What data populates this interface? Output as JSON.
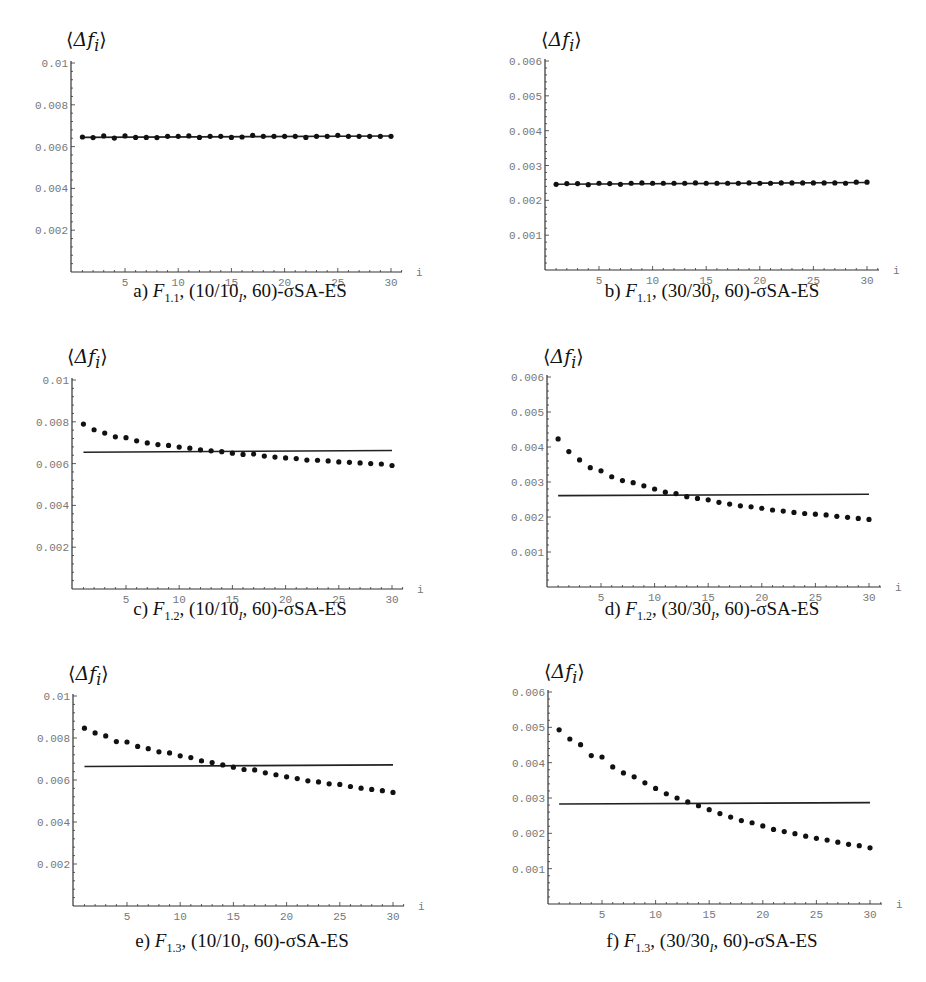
{
  "chart_data": [
    {
      "id": "a",
      "type": "scatter",
      "title": "a) F1.1, (10/10I, 60)-σSA-ES",
      "caption": {
        "letter": "a)",
        "func": "F",
        "func_sub": "1.1",
        "mu": "10/10",
        "mu_sub": "I",
        "lambda": "60",
        "suffix": "-σSA-ES"
      },
      "ylabel": "⟨Δf_i⟩",
      "xlabel": "i",
      "ylim": [
        0,
        0.01
      ],
      "xlim": [
        0,
        31
      ],
      "yticks": [
        0.002,
        0.004,
        0.006,
        0.008,
        0.01
      ],
      "ytick_labels": [
        "0.002",
        "0.004",
        "0.006",
        "0.008",
        "0.01"
      ],
      "xticks": [
        5,
        10,
        15,
        20,
        25,
        30
      ],
      "grid": false,
      "x": [
        1,
        2,
        3,
        4,
        5,
        6,
        7,
        8,
        9,
        10,
        11,
        12,
        13,
        14,
        15,
        16,
        17,
        18,
        19,
        20,
        21,
        22,
        23,
        24,
        25,
        26,
        27,
        28,
        29,
        30
      ],
      "series": [
        {
          "name": "measured",
          "style": "dots",
          "values": [
            0.00646,
            0.00643,
            0.00651,
            0.00641,
            0.00651,
            0.00644,
            0.00644,
            0.00643,
            0.00649,
            0.00649,
            0.00651,
            0.00644,
            0.00649,
            0.00649,
            0.00644,
            0.00646,
            0.00654,
            0.00649,
            0.00649,
            0.00649,
            0.00649,
            0.00644,
            0.00649,
            0.00649,
            0.00654,
            0.00649,
            0.00649,
            0.00649,
            0.00649,
            0.00649
          ]
        },
        {
          "name": "theory",
          "style": "line",
          "values_endpoints": [
            0.00644,
            0.00651
          ]
        }
      ]
    },
    {
      "id": "b",
      "type": "scatter",
      "title": "b) F1.1, (30/30I, 60)-σSA-ES",
      "caption": {
        "letter": "b)",
        "func": "F",
        "func_sub": "1.1",
        "mu": "30/30",
        "mu_sub": "I",
        "lambda": "60",
        "suffix": "-σSA-ES"
      },
      "ylabel": "⟨Δf_i⟩",
      "xlabel": "i",
      "ylim": [
        0,
        0.006
      ],
      "xlim": [
        0,
        31
      ],
      "yticks": [
        0.001,
        0.002,
        0.003,
        0.004,
        0.005,
        0.006
      ],
      "ytick_labels": [
        "0.001",
        "0.002",
        "0.003",
        "0.004",
        "0.005",
        "0.006"
      ],
      "xticks": [
        5,
        10,
        15,
        20,
        25,
        30
      ],
      "grid": false,
      "x": [
        1,
        2,
        3,
        4,
        5,
        6,
        7,
        8,
        9,
        10,
        11,
        12,
        13,
        14,
        15,
        16,
        17,
        18,
        19,
        20,
        21,
        22,
        23,
        24,
        25,
        26,
        27,
        28,
        29,
        30
      ],
      "series": [
        {
          "name": "measured",
          "style": "dots",
          "values": [
            0.00246,
            0.00248,
            0.00248,
            0.00245,
            0.00249,
            0.00248,
            0.00246,
            0.00249,
            0.0025,
            0.00249,
            0.00249,
            0.00249,
            0.00249,
            0.0025,
            0.00249,
            0.00249,
            0.00249,
            0.00249,
            0.0025,
            0.00249,
            0.00249,
            0.0025,
            0.0025,
            0.0025,
            0.0025,
            0.0025,
            0.0025,
            0.00249,
            0.00252,
            0.00252
          ]
        },
        {
          "name": "theory",
          "style": "line",
          "values_endpoints": [
            0.00246,
            0.00251
          ]
        }
      ]
    },
    {
      "id": "c",
      "type": "scatter",
      "title": "c) F1.2, (10/10I, 60)-σSA-ES",
      "caption": {
        "letter": "c)",
        "func": "F",
        "func_sub": "1.2",
        "mu": "10/10",
        "mu_sub": "I",
        "lambda": "60",
        "suffix": "-σSA-ES"
      },
      "ylabel": "⟨Δf_i⟩",
      "xlabel": "i",
      "ylim": [
        0,
        0.01
      ],
      "xlim": [
        0,
        31
      ],
      "yticks": [
        0.002,
        0.004,
        0.006,
        0.008,
        0.01
      ],
      "ytick_labels": [
        "0.002",
        "0.004",
        "0.006",
        "0.008",
        "0.01"
      ],
      "xticks": [
        5,
        10,
        15,
        20,
        25,
        30
      ],
      "grid": false,
      "x": [
        1,
        2,
        3,
        4,
        5,
        6,
        7,
        8,
        9,
        10,
        11,
        12,
        13,
        14,
        15,
        16,
        17,
        18,
        19,
        20,
        21,
        22,
        23,
        24,
        25,
        26,
        27,
        28,
        29,
        30
      ],
      "series": [
        {
          "name": "measured",
          "style": "dots",
          "values": [
            0.00789,
            0.00762,
            0.00746,
            0.00728,
            0.00724,
            0.00709,
            0.00699,
            0.00691,
            0.00687,
            0.00679,
            0.00674,
            0.00666,
            0.00661,
            0.00657,
            0.0065,
            0.00644,
            0.00646,
            0.00636,
            0.00631,
            0.00627,
            0.00624,
            0.00617,
            0.00616,
            0.00613,
            0.00608,
            0.00606,
            0.00603,
            0.006,
            0.00598,
            0.00591
          ]
        },
        {
          "name": "theory",
          "style": "line",
          "values_endpoints": [
            0.00654,
            0.00663
          ]
        }
      ]
    },
    {
      "id": "d",
      "type": "scatter",
      "title": "d) F1.2, (30/30I, 60)-σSA-ES",
      "caption": {
        "letter": "d)",
        "func": "F",
        "func_sub": "1.2",
        "mu": "30/30",
        "mu_sub": "I",
        "lambda": "60",
        "suffix": "-σSA-ES"
      },
      "ylabel": "⟨Δf_i⟩",
      "xlabel": "i",
      "ylim": [
        0,
        0.006
      ],
      "xlim": [
        0,
        31
      ],
      "yticks": [
        0.001,
        0.002,
        0.003,
        0.004,
        0.005,
        0.006
      ],
      "ytick_labels": [
        "0.001",
        "0.002",
        "0.003",
        "0.004",
        "0.005",
        "0.006"
      ],
      "xticks": [
        5,
        10,
        15,
        20,
        25,
        30
      ],
      "grid": false,
      "x": [
        1,
        2,
        3,
        4,
        5,
        6,
        7,
        8,
        9,
        10,
        11,
        12,
        13,
        14,
        15,
        16,
        17,
        18,
        19,
        20,
        21,
        22,
        23,
        24,
        25,
        26,
        27,
        28,
        29,
        30
      ],
      "series": [
        {
          "name": "measured",
          "style": "dots",
          "values": [
            0.00423,
            0.00387,
            0.00363,
            0.00341,
            0.00332,
            0.00315,
            0.00304,
            0.00298,
            0.00289,
            0.0028,
            0.00271,
            0.00267,
            0.00258,
            0.00253,
            0.00249,
            0.00242,
            0.00237,
            0.00232,
            0.00229,
            0.00225,
            0.0022,
            0.00217,
            0.00213,
            0.0021,
            0.00208,
            0.00206,
            0.00202,
            0.00199,
            0.00196,
            0.00193
          ]
        },
        {
          "name": "theory",
          "style": "line",
          "values_endpoints": [
            0.00261,
            0.00265
          ]
        }
      ]
    },
    {
      "id": "e",
      "type": "scatter",
      "title": "e) F1.3, (10/10I, 60)-σSA-ES",
      "caption": {
        "letter": "e)",
        "func": "F",
        "func_sub": "1.3",
        "mu": "10/10",
        "mu_sub": "I",
        "lambda": "60",
        "suffix": "-σSA-ES"
      },
      "ylabel": "⟨Δf_i⟩",
      "xlabel": "i",
      "ylim": [
        0,
        0.01
      ],
      "xlim": [
        0,
        31
      ],
      "yticks": [
        0.002,
        0.004,
        0.006,
        0.008,
        0.01
      ],
      "ytick_labels": [
        "0.002",
        "0.004",
        "0.006",
        "0.008",
        "0.01"
      ],
      "xticks": [
        5,
        10,
        15,
        20,
        25,
        30
      ],
      "grid": false,
      "x": [
        1,
        2,
        3,
        4,
        5,
        6,
        7,
        8,
        9,
        10,
        11,
        12,
        13,
        14,
        15,
        16,
        17,
        18,
        19,
        20,
        21,
        22,
        23,
        24,
        25,
        26,
        27,
        28,
        29,
        30
      ],
      "series": [
        {
          "name": "measured",
          "style": "dots",
          "values": [
            0.00847,
            0.00824,
            0.0081,
            0.00783,
            0.00781,
            0.0076,
            0.00749,
            0.00734,
            0.00729,
            0.00715,
            0.00707,
            0.00691,
            0.00683,
            0.00672,
            0.00661,
            0.0065,
            0.00648,
            0.00634,
            0.00625,
            0.00615,
            0.00607,
            0.00596,
            0.00591,
            0.00582,
            0.00579,
            0.00569,
            0.00561,
            0.00555,
            0.00549,
            0.00541
          ]
        },
        {
          "name": "theory",
          "style": "line",
          "values_endpoints": [
            0.00664,
            0.00672
          ]
        }
      ]
    },
    {
      "id": "f",
      "type": "scatter",
      "title": "f) F1.3, (30/30I, 60)-σSA-ES",
      "caption": {
        "letter": "f)",
        "func": "F",
        "func_sub": "1.3",
        "mu": "30/30",
        "mu_sub": "I",
        "lambda": "60",
        "suffix": "-σSA-ES"
      },
      "ylabel": "⟨Δf_i⟩",
      "xlabel": "i",
      "ylim": [
        0,
        0.006
      ],
      "xlim": [
        0,
        31
      ],
      "yticks": [
        0.001,
        0.002,
        0.003,
        0.004,
        0.005,
        0.006
      ],
      "ytick_labels": [
        "0.001",
        "0.002",
        "0.003",
        "0.004",
        "0.005",
        "0.006"
      ],
      "xticks": [
        5,
        10,
        15,
        20,
        25,
        30
      ],
      "grid": false,
      "x": [
        1,
        2,
        3,
        4,
        5,
        6,
        7,
        8,
        9,
        10,
        11,
        12,
        13,
        14,
        15,
        16,
        17,
        18,
        19,
        20,
        21,
        22,
        23,
        24,
        25,
        26,
        27,
        28,
        29,
        30
      ],
      "series": [
        {
          "name": "measured",
          "style": "dots",
          "values": [
            0.00493,
            0.00467,
            0.00451,
            0.0042,
            0.00416,
            0.00388,
            0.00371,
            0.0036,
            0.00343,
            0.00327,
            0.00312,
            0.003,
            0.00289,
            0.00278,
            0.00267,
            0.00256,
            0.00246,
            0.00236,
            0.0023,
            0.00221,
            0.00211,
            0.00205,
            0.00199,
            0.00192,
            0.00186,
            0.00181,
            0.00175,
            0.00169,
            0.00165,
            0.00159
          ]
        },
        {
          "name": "theory",
          "style": "line",
          "values_endpoints": [
            0.00283,
            0.00287
          ]
        }
      ]
    }
  ],
  "panels_layout": [
    {
      "id": "a",
      "origin": [
        71,
        272
      ],
      "top_y": 63,
      "x5": 125,
      "x30": 391,
      "axis_end_x": 402,
      "ylabel_pos": [
        66,
        28
      ],
      "caption_pos": [
        240,
        280
      ]
    },
    {
      "id": "b",
      "origin": [
        545,
        270
      ],
      "top_y": 61,
      "x5": 599,
      "x30": 867,
      "axis_end_x": 879,
      "ylabel_pos": [
        541,
        28
      ],
      "caption_pos": [
        712,
        280
      ]
    },
    {
      "id": "c",
      "origin": [
        72,
        589
      ],
      "top_y": 380,
      "x5": 126,
      "x30": 392,
      "axis_end_x": 403,
      "ylabel_pos": [
        67,
        345
      ],
      "caption_pos": [
        240,
        598
      ]
    },
    {
      "id": "d",
      "origin": [
        547,
        587
      ],
      "top_y": 377,
      "x5": 601,
      "x30": 869,
      "axis_end_x": 881,
      "ylabel_pos": [
        543,
        345
      ],
      "caption_pos": [
        712,
        598
      ]
    },
    {
      "id": "e",
      "origin": [
        73,
        906
      ],
      "top_y": 696,
      "x5": 127,
      "x30": 393,
      "axis_end_x": 404,
      "ylabel_pos": [
        68,
        662
      ],
      "caption_pos": [
        242,
        930
      ]
    },
    {
      "id": "f",
      "origin": [
        548,
        904
      ],
      "top_y": 692,
      "x5": 602,
      "x30": 870,
      "axis_end_x": 882,
      "ylabel_pos": [
        544,
        660
      ],
      "caption_pos": [
        712,
        930
      ]
    }
  ]
}
